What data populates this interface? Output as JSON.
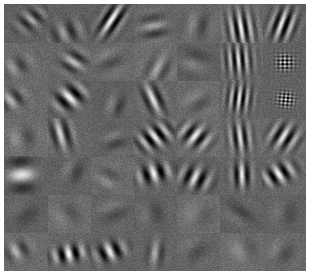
{
  "figure": {
    "kind": "filter-bank-grid",
    "background_color": "#6e6e6e",
    "page_background_color": "#ffffff",
    "margin_left_px": 4,
    "margin_top_px": 4,
    "margin_right_px": 4,
    "margin_bottom_px": 5,
    "grid": {
      "rows": 7,
      "cols": 7,
      "cell_width_px": 43.1,
      "cell_height_px": 38.1,
      "total_patches": 49,
      "gridlines_visible": false
    },
    "noise": {
      "grain_amount": 0.55,
      "grain_seed": 7
    },
    "gray_range": {
      "min": "#1a1a1a",
      "mid": "#6e6e6e",
      "max": "#e8e8e8"
    }
  },
  "chart_data": {
    "type": "heatmap",
    "xlabel": "",
    "ylabel": "",
    "grid_rows": 7,
    "grid_cols": 7,
    "colormap": "gray",
    "value_range": [
      -1,
      1
    ],
    "legend_position": "none",
    "patches": [
      {
        "r": 0,
        "c": 0,
        "kind": "gabor",
        "cx": 0.62,
        "cy": 0.4,
        "sx": 0.26,
        "sy": 0.16,
        "freq": 3.0,
        "angle": -42,
        "phase": 0,
        "amp": 0.5
      },
      {
        "r": 0,
        "c": 1,
        "kind": "gabor",
        "cx": 0.45,
        "cy": 0.72,
        "sx": 0.3,
        "sy": 0.18,
        "freq": 2.4,
        "angle": -20,
        "phase": 1.4,
        "amp": 0.42
      },
      {
        "r": 0,
        "c": 2,
        "kind": "gabor",
        "cx": 0.5,
        "cy": 0.4,
        "sx": 0.16,
        "sy": 0.3,
        "freq": 3.6,
        "angle": 30,
        "phase": 0.3,
        "amp": 0.95
      },
      {
        "r": 0,
        "c": 3,
        "kind": "gabor",
        "cx": 0.48,
        "cy": 0.62,
        "sx": 0.26,
        "sy": 0.2,
        "freq": 2.2,
        "angle": 78,
        "phase": 0.9,
        "amp": 0.4
      },
      {
        "r": 0,
        "c": 4,
        "kind": "gabor",
        "cx": 0.52,
        "cy": 0.55,
        "sx": 0.24,
        "sy": 0.22,
        "freq": 1.8,
        "angle": 10,
        "phase": 2.0,
        "amp": 0.26
      },
      {
        "r": 0,
        "c": 5,
        "kind": "gabor",
        "cx": 0.5,
        "cy": 0.62,
        "sx": 0.22,
        "sy": 0.3,
        "freq": 4.6,
        "angle": -8,
        "phase": 0.0,
        "amp": 0.85
      },
      {
        "r": 0,
        "c": 6,
        "kind": "gabor",
        "cx": 0.48,
        "cy": 0.52,
        "sx": 0.2,
        "sy": 0.28,
        "freq": 4.2,
        "angle": 18,
        "phase": 1.2,
        "amp": 0.88
      },
      {
        "r": 1,
        "c": 0,
        "kind": "gabor",
        "cx": 0.3,
        "cy": 0.62,
        "sx": 0.26,
        "sy": 0.16,
        "freq": 2.0,
        "angle": -28,
        "phase": 1.7,
        "amp": 0.34
      },
      {
        "r": 1,
        "c": 1,
        "kind": "gabor",
        "cx": 0.62,
        "cy": 0.5,
        "sx": 0.22,
        "sy": 0.18,
        "freq": 2.6,
        "angle": -52,
        "phase": 0.4,
        "amp": 0.55
      },
      {
        "r": 1,
        "c": 2,
        "kind": "gabor",
        "cx": 0.44,
        "cy": 0.48,
        "sx": 0.24,
        "sy": 0.22,
        "freq": 1.6,
        "angle": 62,
        "phase": 2.3,
        "amp": 0.22
      },
      {
        "r": 1,
        "c": 3,
        "kind": "gabor",
        "cx": 0.58,
        "cy": 0.7,
        "sx": 0.2,
        "sy": 0.24,
        "freq": 2.4,
        "angle": 24,
        "phase": 0.6,
        "amp": 0.36
      },
      {
        "r": 1,
        "c": 4,
        "kind": "gabor",
        "cx": 0.42,
        "cy": 0.5,
        "sx": 0.26,
        "sy": 0.2,
        "freq": 1.4,
        "angle": -70,
        "phase": 1.1,
        "amp": 0.24
      },
      {
        "r": 1,
        "c": 5,
        "kind": "gabor",
        "cx": 0.44,
        "cy": 0.46,
        "sx": 0.22,
        "sy": 0.26,
        "freq": 5.2,
        "angle": -4,
        "phase": 0.0,
        "amp": 0.8
      },
      {
        "r": 1,
        "c": 6,
        "kind": "blob",
        "cx": 0.52,
        "cy": 0.52,
        "sx": 0.15,
        "sy": 0.15,
        "freq": 7.0,
        "angle": 45,
        "phase": 0.0,
        "amp": 1.0
      },
      {
        "r": 2,
        "c": 0,
        "kind": "gabor",
        "cx": 0.18,
        "cy": 0.5,
        "sx": 0.22,
        "sy": 0.16,
        "freq": 2.4,
        "angle": -34,
        "phase": 0.8,
        "amp": 0.48
      },
      {
        "r": 2,
        "c": 1,
        "kind": "gabor",
        "cx": 0.52,
        "cy": 0.44,
        "sx": 0.26,
        "sy": 0.18,
        "freq": 2.6,
        "angle": -40,
        "phase": 0.2,
        "amp": 0.92
      },
      {
        "r": 2,
        "c": 2,
        "kind": "gabor",
        "cx": 0.6,
        "cy": 0.66,
        "sx": 0.18,
        "sy": 0.18,
        "freq": 2.0,
        "angle": 15,
        "phase": 1.9,
        "amp": 0.3
      },
      {
        "r": 2,
        "c": 3,
        "kind": "gabor",
        "cx": 0.46,
        "cy": 0.48,
        "sx": 0.16,
        "sy": 0.26,
        "freq": 3.0,
        "angle": -22,
        "phase": 0.3,
        "amp": 0.78
      },
      {
        "r": 2,
        "c": 4,
        "kind": "gabor",
        "cx": 0.5,
        "cy": 0.56,
        "sx": 0.24,
        "sy": 0.2,
        "freq": 1.6,
        "angle": 50,
        "phase": 2.1,
        "amp": 0.22
      },
      {
        "r": 2,
        "c": 5,
        "kind": "gabor",
        "cx": 0.46,
        "cy": 0.46,
        "sx": 0.2,
        "sy": 0.24,
        "freq": 5.4,
        "angle": 6,
        "phase": 0.0,
        "amp": 0.82
      },
      {
        "r": 2,
        "c": 6,
        "kind": "blob",
        "cx": 0.54,
        "cy": 0.5,
        "sx": 0.14,
        "sy": 0.14,
        "freq": 7.4,
        "angle": -40,
        "phase": 0.0,
        "amp": 1.0
      },
      {
        "r": 3,
        "c": 0,
        "kind": "gabor",
        "cx": 0.4,
        "cy": 0.5,
        "sx": 0.28,
        "sy": 0.18,
        "freq": 1.4,
        "angle": -10,
        "phase": 1.6,
        "amp": 0.26
      },
      {
        "r": 3,
        "c": 1,
        "kind": "gabor",
        "cx": 0.32,
        "cy": 0.4,
        "sx": 0.18,
        "sy": 0.26,
        "freq": 3.0,
        "angle": -14,
        "phase": 0.5,
        "amp": 0.7
      },
      {
        "r": 3,
        "c": 2,
        "kind": "gabor",
        "cx": 0.58,
        "cy": 0.62,
        "sx": 0.22,
        "sy": 0.18,
        "freq": 1.8,
        "angle": 70,
        "phase": 2.4,
        "amp": 0.24
      },
      {
        "r": 3,
        "c": 3,
        "kind": "gabor",
        "cx": 0.5,
        "cy": 0.48,
        "sx": 0.3,
        "sy": 0.18,
        "freq": 3.4,
        "angle": -34,
        "phase": 0.1,
        "amp": 0.88
      },
      {
        "r": 3,
        "c": 4,
        "kind": "gabor",
        "cx": 0.44,
        "cy": 0.46,
        "sx": 0.26,
        "sy": 0.18,
        "freq": 3.2,
        "angle": 34,
        "phase": 0.2,
        "amp": 0.84
      },
      {
        "r": 3,
        "c": 5,
        "kind": "gabor",
        "cx": 0.48,
        "cy": 0.5,
        "sx": 0.18,
        "sy": 0.26,
        "freq": 4.4,
        "angle": -6,
        "phase": 0.0,
        "amp": 0.76
      },
      {
        "r": 3,
        "c": 6,
        "kind": "gabor",
        "cx": 0.5,
        "cy": 0.48,
        "sx": 0.24,
        "sy": 0.22,
        "freq": 3.6,
        "angle": 28,
        "phase": 0.4,
        "amp": 0.8
      },
      {
        "r": 4,
        "c": 0,
        "kind": "gabor",
        "cx": 0.4,
        "cy": 0.48,
        "sx": 0.3,
        "sy": 0.2,
        "freq": 1.2,
        "angle": 84,
        "phase": 0.0,
        "amp": 0.82
      },
      {
        "r": 4,
        "c": 1,
        "kind": "gabor",
        "cx": 0.62,
        "cy": 0.4,
        "sx": 0.2,
        "sy": 0.18,
        "freq": 1.6,
        "angle": 20,
        "phase": 2.2,
        "amp": 0.26
      },
      {
        "r": 4,
        "c": 2,
        "kind": "gabor",
        "cx": 0.4,
        "cy": 0.58,
        "sx": 0.22,
        "sy": 0.18,
        "freq": 1.8,
        "angle": -60,
        "phase": 1.3,
        "amp": 0.22
      },
      {
        "r": 4,
        "c": 3,
        "kind": "gabor",
        "cx": 0.48,
        "cy": 0.44,
        "sx": 0.28,
        "sy": 0.16,
        "freq": 2.8,
        "angle": -16,
        "phase": 0.2,
        "amp": 0.9
      },
      {
        "r": 4,
        "c": 4,
        "kind": "gabor",
        "cx": 0.44,
        "cy": 0.56,
        "sx": 0.26,
        "sy": 0.18,
        "freq": 3.0,
        "angle": 22,
        "phase": 0.3,
        "amp": 0.82
      },
      {
        "r": 4,
        "c": 5,
        "kind": "gabor",
        "cx": 0.52,
        "cy": 0.48,
        "sx": 0.16,
        "sy": 0.22,
        "freq": 3.8,
        "angle": -2,
        "phase": 0.0,
        "amp": 0.86
      },
      {
        "r": 4,
        "c": 6,
        "kind": "gabor",
        "cx": 0.38,
        "cy": 0.46,
        "sx": 0.28,
        "sy": 0.16,
        "freq": 3.2,
        "angle": -28,
        "phase": 0.1,
        "amp": 0.9
      },
      {
        "r": 5,
        "c": 0,
        "kind": "gabor",
        "cx": 0.5,
        "cy": 0.5,
        "sx": 0.26,
        "sy": 0.22,
        "freq": 1.0,
        "angle": 40,
        "phase": 2.5,
        "amp": 0.18
      },
      {
        "r": 5,
        "c": 1,
        "kind": "gabor",
        "cx": 0.46,
        "cy": 0.52,
        "sx": 0.24,
        "sy": 0.2,
        "freq": 1.2,
        "angle": -30,
        "phase": 2.0,
        "amp": 0.2
      },
      {
        "r": 5,
        "c": 2,
        "kind": "gabor",
        "cx": 0.52,
        "cy": 0.44,
        "sx": 0.22,
        "sy": 0.22,
        "freq": 1.4,
        "angle": 66,
        "phase": 1.8,
        "amp": 0.22
      },
      {
        "r": 5,
        "c": 3,
        "kind": "gabor",
        "cx": 0.46,
        "cy": 0.5,
        "sx": 0.24,
        "sy": 0.2,
        "freq": 1.3,
        "angle": -12,
        "phase": 2.2,
        "amp": 0.2
      },
      {
        "r": 5,
        "c": 4,
        "kind": "gabor",
        "cx": 0.5,
        "cy": 0.54,
        "sx": 0.26,
        "sy": 0.18,
        "freq": 1.1,
        "angle": 18,
        "phase": 1.5,
        "amp": 0.18
      },
      {
        "r": 5,
        "c": 5,
        "kind": "gabor",
        "cx": 0.48,
        "cy": 0.48,
        "sx": 0.22,
        "sy": 0.24,
        "freq": 1.5,
        "angle": -50,
        "phase": 2.6,
        "amp": 0.2
      },
      {
        "r": 5,
        "c": 6,
        "kind": "gabor",
        "cx": 0.52,
        "cy": 0.5,
        "sx": 0.24,
        "sy": 0.2,
        "freq": 1.2,
        "angle": 8,
        "phase": 1.9,
        "amp": 0.18
      },
      {
        "r": 6,
        "c": 0,
        "kind": "gabor",
        "cx": 0.3,
        "cy": 0.48,
        "sx": 0.22,
        "sy": 0.16,
        "freq": 2.2,
        "angle": -24,
        "phase": 0.7,
        "amp": 0.46
      },
      {
        "r": 6,
        "c": 1,
        "kind": "gabor",
        "cx": 0.5,
        "cy": 0.56,
        "sx": 0.28,
        "sy": 0.14,
        "freq": 3.0,
        "angle": -12,
        "phase": 0.1,
        "amp": 0.95
      },
      {
        "r": 6,
        "c": 2,
        "kind": "gabor",
        "cx": 0.46,
        "cy": 0.5,
        "sx": 0.24,
        "sy": 0.16,
        "freq": 2.8,
        "angle": -22,
        "phase": 0.2,
        "amp": 0.88
      },
      {
        "r": 6,
        "c": 3,
        "kind": "gabor",
        "cx": 0.52,
        "cy": 0.54,
        "sx": 0.14,
        "sy": 0.22,
        "freq": 2.6,
        "angle": 6,
        "phase": 0.5,
        "amp": 0.48
      },
      {
        "r": 6,
        "c": 4,
        "kind": "gabor",
        "cx": 0.44,
        "cy": 0.46,
        "sx": 0.22,
        "sy": 0.2,
        "freq": 1.2,
        "angle": 44,
        "phase": 2.3,
        "amp": 0.2
      },
      {
        "r": 6,
        "c": 5,
        "kind": "gabor",
        "cx": 0.54,
        "cy": 0.44,
        "sx": 0.2,
        "sy": 0.2,
        "freq": 1.0,
        "angle": -18,
        "phase": 1.2,
        "amp": 0.28
      },
      {
        "r": 6,
        "c": 6,
        "kind": "gabor",
        "cx": 0.46,
        "cy": 0.52,
        "sx": 0.24,
        "sy": 0.18,
        "freq": 1.3,
        "angle": 30,
        "phase": 2.1,
        "amp": 0.22
      }
    ]
  }
}
